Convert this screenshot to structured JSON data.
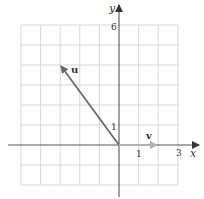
{
  "diagram": {
    "type": "vector-plot",
    "axes": {
      "x_label": "x",
      "y_label": "y",
      "x_range": [
        -5,
        3
      ],
      "y_range": [
        -2,
        6
      ],
      "tick_labels": {
        "x": [
          "1",
          "3"
        ],
        "y": [
          "1",
          "6"
        ]
      },
      "grid": true
    },
    "vectors": [
      {
        "name": "u",
        "label": "u",
        "from": [
          0,
          0
        ],
        "to": [
          -3,
          4
        ],
        "color": "#707070"
      },
      {
        "name": "v",
        "label": "v",
        "from": [
          0,
          0
        ],
        "to": [
          2,
          0
        ],
        "color": "#b0b0b0"
      }
    ],
    "colors": {
      "grid": "#d4d4d4",
      "axis": "#555555",
      "text": "#333333"
    }
  }
}
